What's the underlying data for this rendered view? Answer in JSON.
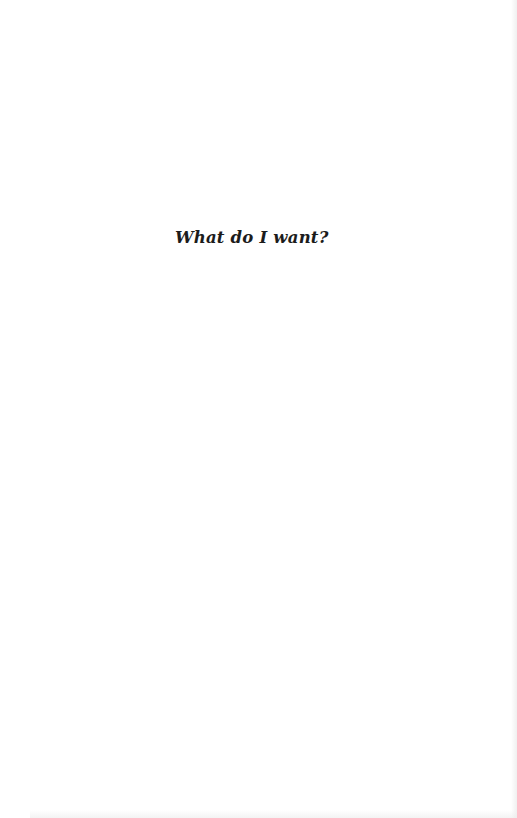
{
  "page": {
    "heading": "What do I want?",
    "background_color": "#ffffff",
    "text_color": "#1c1c1c"
  }
}
